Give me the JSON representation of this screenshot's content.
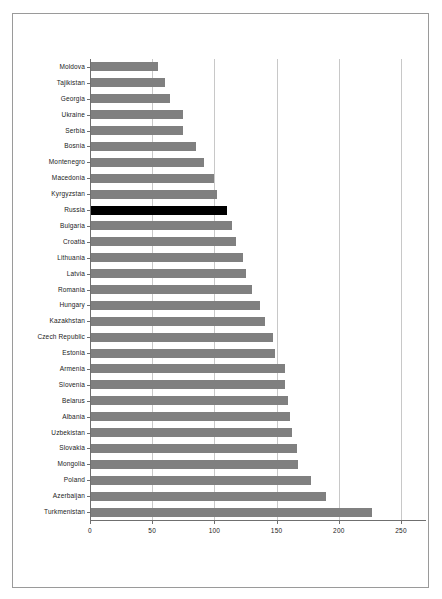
{
  "chart_data": {
    "type": "bar",
    "orientation": "horizontal",
    "title": "",
    "subtitle": "",
    "xlabel": "",
    "ylabel": "",
    "xlim": [
      0,
      250
    ],
    "ylim": null,
    "grid": true,
    "gridlines_axis": "x",
    "legend": null,
    "legend_position": "none",
    "xticks": [
      "0",
      "50",
      "100",
      "150",
      "200",
      "250"
    ],
    "xtick_values": [
      0,
      50,
      100,
      150,
      200,
      250
    ],
    "categories": [
      "Moldova",
      "Tajikistan",
      "Georgia",
      "Ukraine",
      "Serbia",
      "Bosnia",
      "Montenegro",
      "Macedonia",
      "Kyrgyzstan",
      "Russia",
      "Bulgaria",
      "Croatia",
      "Lithuania",
      "Latvia",
      "Romania",
      "Hungary",
      "Kazakhstan",
      "Czech Republic",
      "Estonia",
      "Armenia",
      "Slovenia",
      "Belarus",
      "Albania",
      "Uzbekistan",
      "Slovakia",
      "Mongolia",
      "Poland",
      "Azerbaijan",
      "Turkmenistan"
    ],
    "values": [
      55,
      60,
      64,
      75,
      75,
      85,
      92,
      100,
      102,
      110,
      114,
      117,
      123,
      125,
      130,
      137,
      141,
      147,
      149,
      157,
      157,
      159,
      161,
      162,
      166,
      167,
      178,
      190,
      227
    ],
    "highlight_category": "Russia",
    "colors": {
      "bar": "#808080",
      "bar_highlight": "#000000",
      "grid": "#c8c8c8",
      "axis": "#6f6f6f",
      "frame": "#9a9a9a",
      "text": "#1a1a1a",
      "background": "#ffffff"
    }
  }
}
